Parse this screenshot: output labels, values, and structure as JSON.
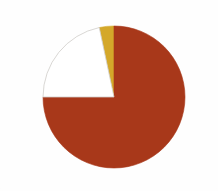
{
  "chart_data": {
    "type": "pie",
    "title": "",
    "subtitle": "",
    "xlabel": "",
    "ylabel": "",
    "legend_position": "none",
    "grid": false,
    "start_angle_deg": 0,
    "direction": "clockwise",
    "center": {
      "cx": 114,
      "cy": 97,
      "r": 71
    },
    "categories": [
      "Segment 1",
      "Segment 2",
      "Segment 3"
    ],
    "values": [
      75,
      22,
      3
    ],
    "units": "percent",
    "slices": [
      {
        "label": "Segment 1",
        "value": 75,
        "percent": "75%",
        "angle_deg": 270,
        "start_deg": 0,
        "end_deg": 270,
        "color": "#a8381a",
        "stroke": "#a8381a"
      },
      {
        "label": "Segment 2",
        "value": 22,
        "percent": "22%",
        "angle_deg": 78,
        "start_deg": 270,
        "end_deg": 348,
        "color": "#ffffff",
        "stroke": "#cfcdc9"
      },
      {
        "label": "Segment 3",
        "value": 3,
        "percent": "3%",
        "angle_deg": 12,
        "start_deg": 348,
        "end_deg": 360,
        "color": "#d4a82a",
        "stroke": "#d4a82a"
      }
    ],
    "colors": {
      "slice_red": "#a8381a",
      "slice_white": "#ffffff",
      "slice_yellow": "#d4a82a",
      "outline": "#cfcdc9",
      "background": "#fefefe"
    }
  }
}
